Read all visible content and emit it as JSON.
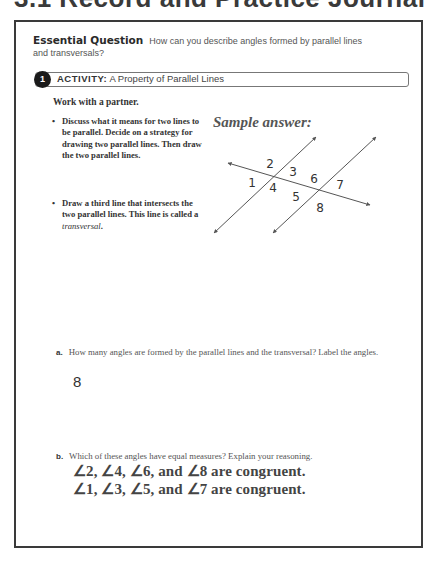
{
  "page": {
    "title": "3.1 Record and Practice Journal"
  },
  "essential_question": {
    "label": "Essential Question",
    "text": "How can you describe angles formed by parallel lines and transversals?"
  },
  "activity": {
    "number": "1",
    "keyword": "ACTIVITY:",
    "title": "A Property of Parallel Lines",
    "instruction": "Work with a partner.",
    "bullets": [
      "Discuss what it means for two lines to be parallel. Decide on a strategy for drawing two parallel lines. Then draw the two parallel lines.",
      "Draw a third line that intersects the two parallel lines. This line is called a"
    ],
    "bullet2_term": "transversal",
    "bullet2_end": "."
  },
  "diagram": {
    "caption": "Sample answer:",
    "angle_labels": [
      "1",
      "2",
      "3",
      "4",
      "5",
      "6",
      "7",
      "8"
    ],
    "line_color": "#555555"
  },
  "questions": {
    "a": {
      "label": "a.",
      "text": "How many angles are formed by the parallel lines and the transversal? Label the angles.",
      "answer": "8"
    },
    "b": {
      "label": "b.",
      "text": "Which of these angles have equal measures? Explain your reasoning.",
      "answer_lines": [
        "∠2, ∠4, ∠6, and ∠8 are congruent.",
        "∠1, ∠3, ∠5, and ∠7 are congruent."
      ]
    }
  }
}
